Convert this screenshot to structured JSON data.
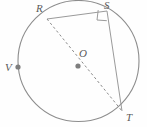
{
  "figure": {
    "kind": "circle-geometry-diagram",
    "width": 147,
    "height": 127,
    "background_color": "#fefefe",
    "stroke_color": "#8a8a8a",
    "label_color": "#5a5a5a",
    "point_color": "#7a7a7a"
  },
  "circle": {
    "center_x": 78.5,
    "center_y": 61,
    "radius": 60.5,
    "stroke_color": "#8d8d8d",
    "stroke_width": 1,
    "fill": "none"
  },
  "points": {
    "R": {
      "label": "R",
      "x": 47,
      "y": 19,
      "dot": false
    },
    "S": {
      "label": "S",
      "x": 107,
      "y": 11,
      "dot": false
    },
    "O": {
      "label": "O",
      "x": 78,
      "y": 66,
      "dot": true
    },
    "V": {
      "label": "V",
      "x": 18,
      "y": 67,
      "dot": true
    },
    "T": {
      "label": "T",
      "x": 122,
      "y": 111,
      "dot": false
    }
  },
  "segments": [
    {
      "name": "RS",
      "from": "R",
      "to": "S",
      "style": "solid"
    },
    {
      "name": "ST",
      "from": "S",
      "to": "T",
      "style": "solid"
    },
    {
      "name": "RT",
      "from": "R",
      "to": "T",
      "style": "dashed",
      "note": "diameter through O"
    }
  ],
  "right_angle": {
    "at": "S",
    "size": 9,
    "style": "solid"
  },
  "labels": {
    "R": "R",
    "S": "S",
    "O": "O",
    "V": "V",
    "T": "T"
  }
}
